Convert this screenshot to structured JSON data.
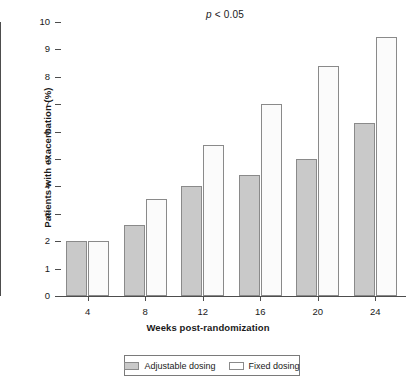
{
  "chart_data": {
    "type": "bar",
    "title": "",
    "annotation": "p < 0.05",
    "annotation_prefix": "p",
    "annotation_rest": " < 0.05",
    "xlabel": "Weeks post-randomization",
    "ylabel": "Patients with exacerbation (%)",
    "categories": [
      "4",
      "8",
      "12",
      "16",
      "20",
      "24"
    ],
    "ylim": [
      0,
      10
    ],
    "yticks": [
      "0",
      "1",
      "2",
      "3",
      "4",
      "5",
      "6",
      "7",
      "8",
      "9",
      "10"
    ],
    "grid": false,
    "legend_position": "bottom",
    "series": [
      {
        "name": "Adjustable dosing",
        "color": "#c9c9c9",
        "values": [
          2.0,
          2.6,
          4.0,
          4.4,
          5.0,
          6.3
        ]
      },
      {
        "name": "Fixed dosing",
        "color": "#ffffff",
        "values": [
          2.0,
          3.55,
          5.5,
          7.0,
          8.4,
          9.45
        ]
      }
    ]
  },
  "legend": {
    "items": [
      {
        "label": "Adjustable dosing",
        "swatch": "adjustable"
      },
      {
        "label": "Fixed dosing",
        "swatch": "fixed"
      }
    ]
  }
}
